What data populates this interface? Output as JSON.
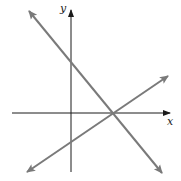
{
  "diagram": {
    "axes": {
      "x_label": "x",
      "y_label": "y",
      "origin": [
        71,
        113
      ],
      "x_axis": {
        "from": [
          12,
          113
        ],
        "to": [
          170,
          113
        ]
      },
      "y_axis": {
        "from": [
          71,
          172
        ],
        "to": [
          71,
          10
        ]
      }
    },
    "lines": [
      {
        "name": "decreasing-line",
        "from": [
          29,
          11
        ],
        "to": [
          162,
          173
        ],
        "color": "#7a7a7a",
        "double_arrow": true
      },
      {
        "name": "increasing-line",
        "from": [
          27,
          172
        ],
        "to": [
          168,
          76
        ],
        "color": "#7a7a7a",
        "double_arrow": true
      }
    ],
    "intersection": [
      113,
      113
    ],
    "colors": {
      "axis": "#1a1a1a",
      "line": "#7a7a7a"
    }
  }
}
